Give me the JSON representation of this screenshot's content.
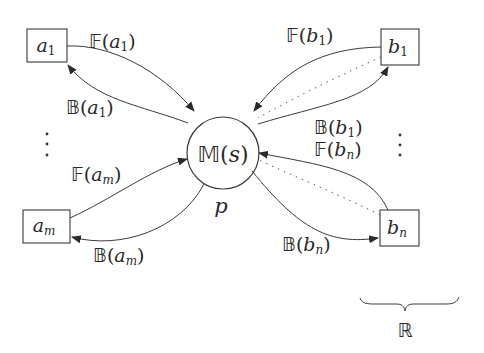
{
  "diagram": {
    "center_node": {
      "label_letter": "M",
      "label_arg": "s",
      "caption": "p"
    },
    "left_nodes": [
      {
        "id": "a1",
        "base": "a",
        "sub": "1"
      },
      {
        "id": "am",
        "base": "a",
        "sub": "m"
      }
    ],
    "right_nodes": [
      {
        "id": "b1",
        "base": "b",
        "sub": "1"
      },
      {
        "id": "bn",
        "base": "b",
        "sub": "n"
      }
    ],
    "edge_labels": {
      "F_a1": {
        "op": "F",
        "base": "a",
        "sub": "1"
      },
      "B_a1": {
        "op": "B",
        "base": "a",
        "sub": "1"
      },
      "F_am": {
        "op": "F",
        "base": "a",
        "sub": "m"
      },
      "B_am": {
        "op": "B",
        "base": "a",
        "sub": "m"
      },
      "F_b1": {
        "op": "F",
        "base": "b",
        "sub": "1"
      },
      "B_b1": {
        "op": "B",
        "base": "b",
        "sub": "1"
      },
      "F_bn": {
        "op": "F",
        "base": "b",
        "sub": "n"
      },
      "B_bn": {
        "op": "B",
        "base": "b",
        "sub": "n"
      }
    },
    "ellipsis": "⋮",
    "brace_label": "R",
    "colors": {
      "stroke": "#3a3a3a",
      "background": "#ffffff"
    }
  }
}
